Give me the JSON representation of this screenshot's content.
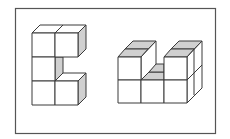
{
  "figure": {
    "colors": {
      "stroke": "#3a3a3a",
      "face": "#ffffff",
      "shade": "#cfcfcf",
      "frame": "#555555"
    },
    "left_figure": {
      "name": "C-shaped cube stack",
      "cube_count": 5
    },
    "right_figure": {
      "name": "U-shaped cube block",
      "cube_count": 11
    }
  }
}
